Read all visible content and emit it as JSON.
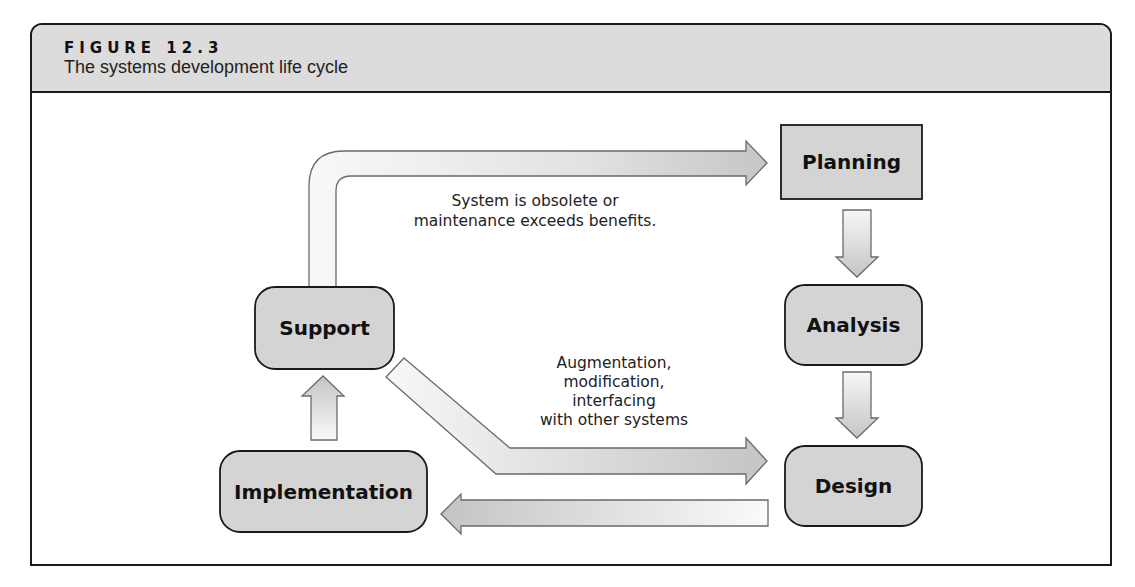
{
  "figure": {
    "label": "FIGURE 12.3",
    "title": "The systems development life cycle"
  },
  "nodes": {
    "planning": "Planning",
    "analysis": "Analysis",
    "design": "Design",
    "implementation": "Implementation",
    "support": "Support"
  },
  "annotations": {
    "obsolete": [
      "System is obsolete or",
      "maintenance exceeds benefits."
    ],
    "augmentation": [
      "Augmentation,",
      "modification,",
      "interfacing",
      "with other systems"
    ]
  },
  "colors": {
    "box_fill": "#d4d4d4",
    "header_fill": "#dcdcdc",
    "stroke": "#1a1a1a",
    "arrow_stroke": "#6a6a6a"
  }
}
